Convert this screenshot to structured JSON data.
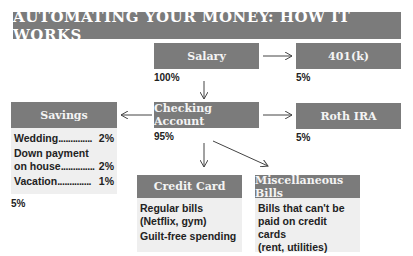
{
  "title": "AUTOMATING YOUR MONEY: HOW IT WORKS",
  "nodes": {
    "salary": {
      "label": "Salary",
      "percent": "100%"
    },
    "k401": {
      "label": "401(k)",
      "percent": "5%"
    },
    "checking": {
      "label": "Checking Account",
      "percent": "95%"
    },
    "roth": {
      "label": "Roth IRA",
      "percent": "5%"
    },
    "savings": {
      "label": "Savings",
      "percent": "5%",
      "items": [
        {
          "name": "Wedding",
          "dots": "..............",
          "value": "2%"
        },
        {
          "name": "Down payment",
          "name2": "on house",
          "dots": "..............",
          "value": "2%"
        },
        {
          "name": "Vacation",
          "dots": "..............",
          "value": "1%"
        }
      ]
    },
    "credit": {
      "label": "Credit Card",
      "lines": [
        "Regular bills",
        "(Netflix, gym)",
        "Guilt-free spending"
      ]
    },
    "misc": {
      "label": "Miscellaneous Bills",
      "lines": [
        "Bills that can't be",
        "paid on credit cards",
        "(rent, utilities)"
      ]
    }
  },
  "edges": [
    {
      "from": "salary",
      "to": "k401"
    },
    {
      "from": "salary",
      "to": "checking"
    },
    {
      "from": "checking",
      "to": "savings"
    },
    {
      "from": "checking",
      "to": "roth"
    },
    {
      "from": "checking",
      "to": "credit"
    },
    {
      "from": "checking",
      "to": "misc"
    }
  ],
  "colors": {
    "box": "#7b7b7b",
    "panel": "#efefef",
    "text": "#222222"
  }
}
